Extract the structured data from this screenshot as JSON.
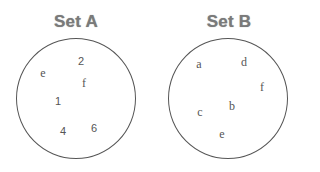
{
  "sets": [
    {
      "title": "Set A",
      "circle": {
        "cx": 76,
        "cy": 98,
        "r": 60
      },
      "elements": [
        {
          "label": "2",
          "x": 81,
          "y": 61,
          "kind": "digit"
        },
        {
          "label": "e",
          "x": 43,
          "y": 73,
          "kind": "letter"
        },
        {
          "label": "f",
          "x": 84,
          "y": 83,
          "kind": "letter"
        },
        {
          "label": "1",
          "x": 58,
          "y": 101,
          "kind": "digit"
        },
        {
          "label": "4",
          "x": 63,
          "y": 131,
          "kind": "digit"
        },
        {
          "label": "6",
          "x": 94,
          "y": 128,
          "kind": "digit"
        }
      ]
    },
    {
      "title": "Set B",
      "circle": {
        "cx": 228,
        "cy": 98,
        "r": 60
      },
      "elements": [
        {
          "label": "a",
          "x": 199,
          "y": 64,
          "kind": "letter"
        },
        {
          "label": "d",
          "x": 244,
          "y": 62,
          "kind": "letter"
        },
        {
          "label": "f",
          "x": 262,
          "y": 87,
          "kind": "letter"
        },
        {
          "label": "b",
          "x": 232,
          "y": 106,
          "kind": "letter"
        },
        {
          "label": "c",
          "x": 200,
          "y": 112,
          "kind": "letter"
        },
        {
          "label": "e",
          "x": 222,
          "y": 134,
          "kind": "letter"
        }
      ]
    }
  ],
  "colors": {
    "title": "#7a7a7a",
    "circle_stroke": "#555555",
    "element_text": "#555555",
    "background": "#ffffff"
  }
}
